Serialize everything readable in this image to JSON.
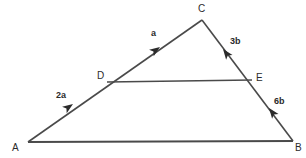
{
  "figure": {
    "type": "geometry-vector-diagram",
    "background_color": "#ffffff",
    "stroke_color": "#4a4a4a",
    "label_color": "#2b2b2b",
    "width": 306,
    "height": 158
  },
  "points": {
    "A": {
      "label": "A",
      "x": 28,
      "y": 142,
      "label_x": 12,
      "label_y": 143
    },
    "B": {
      "label": "B",
      "x": 293,
      "y": 141,
      "label_x": 295,
      "label_y": 143
    },
    "C": {
      "label": "C",
      "x": 202,
      "y": 20,
      "label_x": 198,
      "label_y": 4
    },
    "D": {
      "label": "D",
      "x": 107,
      "y": 81,
      "label_x": 97,
      "label_y": 71
    },
    "E": {
      "label": "E",
      "x": 252,
      "y": 81,
      "label_x": 256,
      "label_y": 73
    }
  },
  "segments": [
    {
      "name": "AC",
      "from": "A",
      "to": "C"
    },
    {
      "name": "CB",
      "from": "C",
      "to": "B"
    },
    {
      "name": "AB",
      "from": "A",
      "to": "B"
    },
    {
      "name": "DE",
      "from": "D",
      "to": "E"
    }
  ],
  "vectors": [
    {
      "name": "AD",
      "label": "2a",
      "label_x": 56,
      "label_y": 91,
      "arrow_x": 73,
      "arrow_y": 104,
      "angle_deg": -31
    },
    {
      "name": "DC",
      "label": "a",
      "label_x": 151,
      "label_y": 29,
      "arrow_x": 160,
      "arrow_y": 47,
      "angle_deg": -31
    },
    {
      "name": "CE",
      "label": "3b",
      "label_x": 230,
      "label_y": 37,
      "arrow_x": 224,
      "arrow_y": 49,
      "angle_deg": 115
    },
    {
      "name": "EB",
      "label": "6b",
      "label_x": 274,
      "label_y": 97,
      "arrow_x": 270,
      "arrow_y": 108,
      "angle_deg": 115
    }
  ]
}
